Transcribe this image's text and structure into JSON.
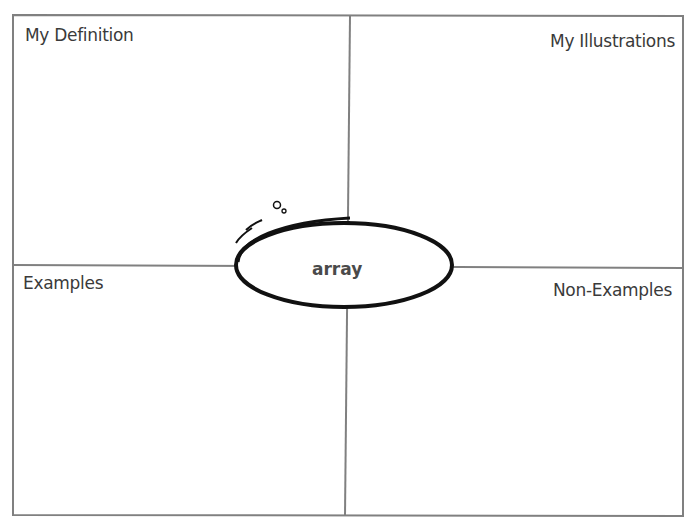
{
  "organizer": {
    "type": "Frayer Model",
    "center_word": "array",
    "quadrants": [
      {
        "position": "top-left",
        "label": "My Definition"
      },
      {
        "position": "top-right",
        "label": "My Illustrations"
      },
      {
        "position": "bottom-left",
        "label": "Examples"
      },
      {
        "position": "bottom-right",
        "label": "Non-Examples"
      }
    ],
    "colors": {
      "border": "#808080",
      "ellipse_stroke": "#111111",
      "text": "#3a3a3a"
    }
  }
}
